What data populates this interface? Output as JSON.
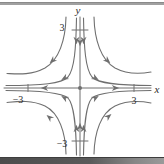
{
  "figure": {
    "type": "phase-portrait",
    "labels": {
      "x_axis": "x",
      "y_axis": "y",
      "x_tick_neg": "−3",
      "x_tick_pos": "3",
      "y_tick_pos": "3",
      "y_tick_neg": "−3"
    },
    "axes": {
      "x_range": [
        -3,
        3
      ],
      "y_range": [
        -3,
        3
      ],
      "x_ticks": [
        "−3",
        "3"
      ],
      "y_ticks": [
        "3",
        "−3"
      ]
    },
    "flow": {
      "x_axis_direction": "outward from origin",
      "y_axis_direction": "inward toward origin",
      "quadrants": "trajectories descend along the y-axis then sweep out along the x-axis"
    },
    "colors": {
      "curve": "#6f6f6f",
      "text": "#2b2b2b",
      "background": "#ffffff",
      "top_rule": "#a0a0a0",
      "bottom_bar_dark": "#4c4c4c",
      "bottom_bar_light": "#9a9a9a"
    }
  }
}
